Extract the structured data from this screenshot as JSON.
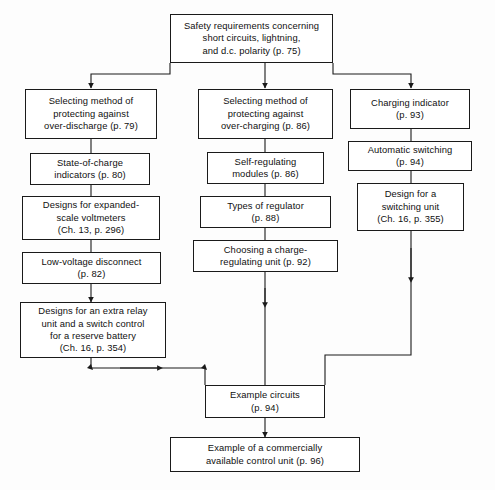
{
  "diagram": {
    "stroke_color": "#1a1a1a",
    "box_fill": "#ffffff",
    "background": "#fdfdfd",
    "nodes": [
      {
        "id": "safety-requirements",
        "label": "Safety requirements concerning\nshort circuits, lightning,\nand d.c. polarity (p. 75)"
      },
      {
        "id": "selecting-over-discharge",
        "label": "Selecting method of\nprotecting against\nover-discharge (p. 79)"
      },
      {
        "id": "state-of-charge-indicators",
        "label": "State-of-charge\nindicators (p. 80)"
      },
      {
        "id": "expanded-scale-voltmeters",
        "label": "Designs for expanded-\nscale voltmeters\n(Ch. 13, p. 296)"
      },
      {
        "id": "low-voltage-disconnect",
        "label": "Low-voltage disconnect\n(p. 82)"
      },
      {
        "id": "extra-relay-unit",
        "label": "Designs for an extra relay\nunit and a switch control\nfor a reserve battery\n(Ch. 16, p. 354)"
      },
      {
        "id": "selecting-over-charging",
        "label": "Selecting method of\nprotecting against\nover-charging (p. 86)"
      },
      {
        "id": "self-regulating-modules",
        "label": "Self-regulating\nmodules (p. 86)"
      },
      {
        "id": "types-of-regulator",
        "label": "Types of regulator\n(p. 88)"
      },
      {
        "id": "choosing-charge-regulating-unit",
        "label": "Choosing a charge-\nregulating unit (p. 92)"
      },
      {
        "id": "charging-indicator",
        "label": "Charging indicator\n(p. 93)"
      },
      {
        "id": "automatic-switching",
        "label": "Automatic switching\n(p. 94)"
      },
      {
        "id": "design-switching-unit",
        "label": "Design for a\nswitching unit\n(Ch. 16, p. 355)"
      },
      {
        "id": "example-circuits",
        "label": "Example circuits\n(p. 94)"
      },
      {
        "id": "commercial-control-unit",
        "label": "Example of a commercially\navailable control unit (p. 96)"
      }
    ]
  }
}
